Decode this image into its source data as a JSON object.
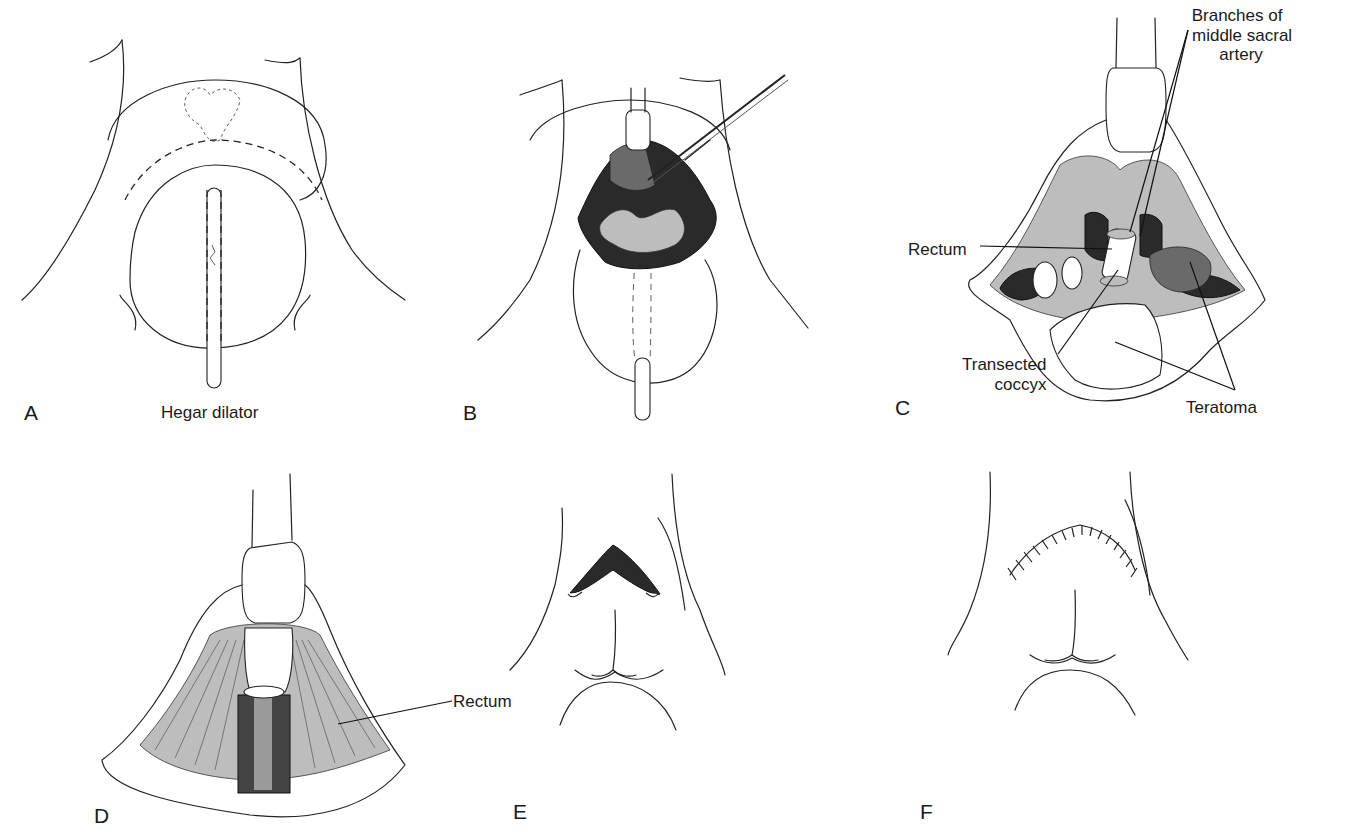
{
  "figure": {
    "panels": [
      {
        "id": "A",
        "letter": "A",
        "annotations": [
          "Hegar dilator"
        ]
      },
      {
        "id": "B",
        "letter": "B",
        "annotations": []
      },
      {
        "id": "C",
        "letter": "C",
        "annotations": [
          "Branches of middle sacral artery",
          "Rectum",
          "Transected coccyx",
          "Teratoma"
        ]
      },
      {
        "id": "D",
        "letter": "D",
        "annotations": [
          "Rectum"
        ]
      },
      {
        "id": "E",
        "letter": "E",
        "annotations": []
      },
      {
        "id": "F",
        "letter": "F",
        "annotations": []
      }
    ],
    "labels": {
      "a": {
        "letter": "A",
        "hegar": "Hegar dilator"
      },
      "b": {
        "letter": "B"
      },
      "c": {
        "letter": "C",
        "branches_line1": "Branches of",
        "branches_line2": "middle sacral",
        "branches_line3": "artery",
        "rectum": "Rectum",
        "transected_line1": "Transected",
        "transected_line2": "coccyx",
        "teratoma": "Teratoma"
      },
      "d": {
        "letter": "D",
        "rectum": "Rectum"
      },
      "e": {
        "letter": "E"
      },
      "f": {
        "letter": "F"
      }
    }
  }
}
